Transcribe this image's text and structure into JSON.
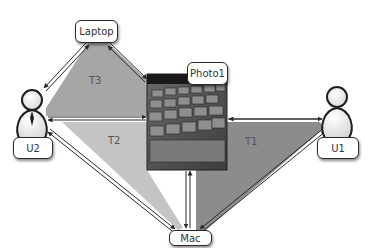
{
  "nodes": {
    "laptop": {
      "label": "Laptop"
    },
    "photo": {
      "label": "Photo1"
    },
    "mac": {
      "label": "Mac"
    },
    "u1": {
      "label": "U1"
    },
    "u2": {
      "label": "U2"
    }
  },
  "triangles": {
    "t1": {
      "label": "T1",
      "color": "#8c8c8c"
    },
    "t2": {
      "label": "T2",
      "color": "#c4c4c4"
    },
    "t3": {
      "label": "T3",
      "color": "#a6a6a6"
    }
  },
  "colors": {
    "edge": "#2a2a2a",
    "background": "#ffffff"
  }
}
